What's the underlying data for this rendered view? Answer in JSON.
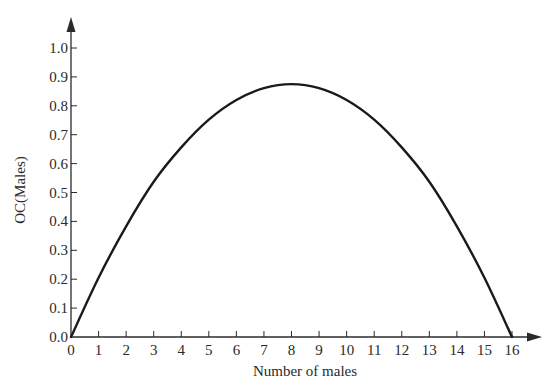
{
  "chart_data": {
    "type": "line",
    "title": "",
    "xlabel": "Number of males",
    "ylabel": "OC(Males)",
    "xlim": [
      0,
      16
    ],
    "ylim": [
      0.0,
      1.0
    ],
    "grid": false,
    "legend": null,
    "x_ticks": [
      "0",
      "1",
      "2",
      "3",
      "4",
      "5",
      "6",
      "7",
      "8",
      "9",
      "10",
      "11",
      "12",
      "13",
      "14",
      "15",
      "16"
    ],
    "y_ticks": [
      "0.0",
      "0.1",
      "0.2",
      "0.3",
      "0.4",
      "0.5",
      "0.6",
      "0.7",
      "0.8",
      "0.9",
      "1.0"
    ],
    "series": [
      {
        "name": "OC(Males)",
        "x": [
          0,
          1,
          2,
          3,
          4,
          5,
          6,
          7,
          8,
          9,
          10,
          11,
          12,
          13,
          14,
          15,
          16
        ],
        "values": [
          0.0,
          0.205,
          0.383,
          0.537,
          0.656,
          0.752,
          0.82,
          0.861,
          0.875,
          0.861,
          0.82,
          0.752,
          0.656,
          0.537,
          0.383,
          0.205,
          0.0
        ]
      }
    ]
  },
  "style": {
    "line_color": "#1a1a1a",
    "axis_color": "#2a2a2a",
    "text_color": "#2a2a2a",
    "background": "#ffffff"
  }
}
